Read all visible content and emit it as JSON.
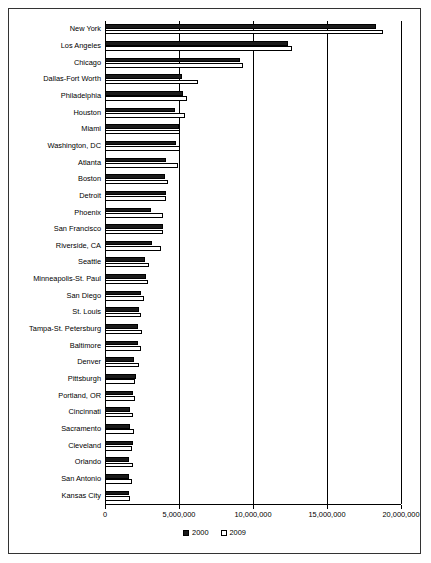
{
  "chart_data": {
    "type": "bar",
    "orientation": "horizontal",
    "title": "",
    "xlabel": "",
    "ylabel": "",
    "xlim": [
      0,
      20000000
    ],
    "xticks": [
      0,
      5000000,
      10000000,
      15000000,
      20000000
    ],
    "xtick_labels": [
      "0",
      "5,000,000",
      "10,000,000",
      "15,000,000",
      "20,000,000"
    ],
    "grid": true,
    "legend_position": "bottom",
    "categories": [
      "Kansas City",
      "San Antonio",
      "Orlando",
      "Cleveland",
      "Sacramento",
      "Cincinnati",
      "Portland, OR",
      "Pittsburgh",
      "Denver",
      "Baltimore",
      "Tampa-St. Petersburg",
      "St. Louis",
      "San Diego",
      "Minneapolis-St. Paul",
      "Seattle",
      "Riverside, CA",
      "San Francisco",
      "Phoenix",
      "Detroit",
      "Boston",
      "Atlanta",
      "Washington, DC",
      "Miami",
      "Houston",
      "Philadelphia",
      "Dallas-Fort Worth",
      "Chicago",
      "Los Angeles",
      "New York"
    ],
    "series": [
      {
        "name": "2000",
        "color": "#1a1a1a",
        "values": [
          1600000,
          1600000,
          1650000,
          1900000,
          1700000,
          1700000,
          1900000,
          2100000,
          1950000,
          2250000,
          2250000,
          2300000,
          2450000,
          2800000,
          2700000,
          3150000,
          3900000,
          3100000,
          4150000,
          4050000,
          4100000,
          4800000,
          5000000,
          4700000,
          5300000,
          5200000,
          9100000,
          12350000,
          18300000
        ]
      },
      {
        "name": "2009",
        "color": "#ffffff",
        "values": [
          1700000,
          1800000,
          1900000,
          1850000,
          1950000,
          1900000,
          2050000,
          2050000,
          2300000,
          2400000,
          2500000,
          2450000,
          2650000,
          2900000,
          3000000,
          3800000,
          3950000,
          3900000,
          4100000,
          4250000,
          4950000,
          5100000,
          5100000,
          5400000,
          5550000,
          6300000,
          9350000,
          12650000,
          18800000
        ]
      }
    ],
    "legend": [
      {
        "label": "2000",
        "swatch": "filled-black"
      },
      {
        "label": "2009",
        "swatch": "hollow-white"
      }
    ]
  }
}
